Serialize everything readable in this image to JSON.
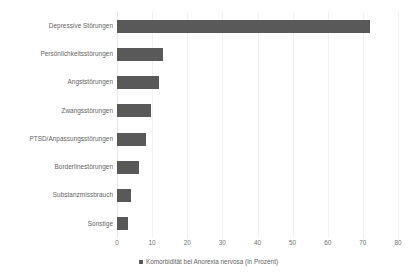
{
  "chart_data": {
    "type": "bar",
    "orientation": "horizontal",
    "title": "",
    "subtitle": "",
    "xlabel": "",
    "ylabel": "",
    "xlim": [
      0,
      80
    ],
    "xticks": [
      0,
      10,
      20,
      30,
      40,
      50,
      60,
      70,
      80
    ],
    "xtick_labels": [
      "0",
      "10",
      "20",
      "30",
      "40",
      "50",
      "60",
      "70",
      "80"
    ],
    "grid": true,
    "grid_axis": "x",
    "legend_position": "bottom-center",
    "legend": [
      "Komorbidität bei Anorexia nervosa (in Prozent)"
    ],
    "series_name": "Komorbidität bei Anorexia nervosa (in Prozent)",
    "bar_color": "#595959",
    "categories": [
      "Depressive Störungen",
      "Persönlichkeitsstörungen",
      "Angststörungen",
      "Zwangsstörungen",
      "PTSD/Anpassungsstörungen",
      "Borderlinestörungen",
      "Substanzmissbrauch",
      "Sonstige"
    ],
    "values": [
      72,
      13,
      12,
      9.7,
      8.3,
      6.3,
      4,
      3
    ]
  },
  "legend": {
    "marker": "square-marker",
    "label": "Komorbidität bei Anorexia nervosa (in Prozent)"
  }
}
